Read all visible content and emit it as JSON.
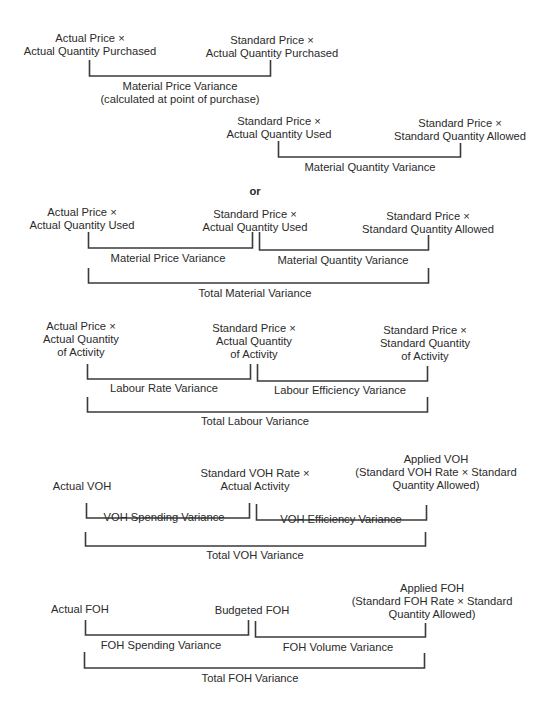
{
  "material_purchase": {
    "left": [
      "Actual Price ×",
      "Actual Quantity Purchased"
    ],
    "right": [
      "Standard Price ×",
      "Actual Quantity Purchased"
    ],
    "variance": [
      "Material Price Variance",
      "(calculated at point of purchase)"
    ]
  },
  "material_usage": {
    "left": [
      "Standard Price ×",
      "Actual Quantity Used"
    ],
    "right": [
      "Standard Price ×",
      "Standard Quantity Allowed"
    ],
    "variance": "Material Quantity Variance"
  },
  "separator": "or",
  "material_combined": {
    "left": [
      "Actual Price ×",
      "Actual Quantity Used"
    ],
    "middle": [
      "Standard Price ×",
      "Actual Quantity Used"
    ],
    "right": [
      "Standard Price ×",
      "Standard Quantity Allowed"
    ],
    "variance_left": "Material Price Variance",
    "variance_right": "Material Quantity Variance",
    "total": "Total Material Variance"
  },
  "labour": {
    "left": [
      "Actual  Price ×",
      "Actual Quantity",
      "of Activity"
    ],
    "middle": [
      "Standard Price ×",
      "Actual Quantity",
      "of Activity"
    ],
    "right": [
      "Standard Price ×",
      "Standard Quantity",
      "of Activity"
    ],
    "variance_left": "Labour Rate Variance",
    "variance_right": "Labour Efficiency Variance",
    "total": "Total Labour Variance"
  },
  "voh": {
    "left": [
      "Actual VOH"
    ],
    "middle": [
      "Standard VOH Rate ×",
      "Actual Activity"
    ],
    "right": [
      "Applied VOH",
      "(Standard VOH Rate × Standard",
      "Quantity Allowed)"
    ],
    "variance_left": "VOH Spending Variance",
    "variance_right": "VOH Efficiency Variance",
    "total": "Total VOH Variance"
  },
  "foh": {
    "left": [
      "Actual FOH"
    ],
    "middle": [
      "Budgeted FOH"
    ],
    "right": [
      "Applied FOH",
      "(Standard FOH Rate × Standard",
      "Quantity Allowed)"
    ],
    "variance_left": "FOH Spending Variance",
    "variance_right": "FOH Volume Variance",
    "total": "Total FOH Variance"
  }
}
